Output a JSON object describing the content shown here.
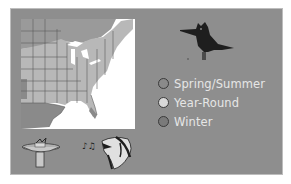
{
  "legend": {
    "items": [
      {
        "label": "Spring/Summer",
        "color": "#8a8a8a"
      },
      {
        "label": "Year-Round",
        "color": "#d9d9d9"
      },
      {
        "label": "Winter",
        "color": "#7a7a7a"
      }
    ]
  },
  "colors": {
    "panel": "#8e8e8e",
    "map_year_round": "#b8b8b8",
    "map_summer": "#9a9a9a",
    "map_winter": "#8a8a8a",
    "bird": "#1e1e1e"
  },
  "icons": {
    "bird": "belted-kingfisher-silhouette-icon",
    "feeder": "bird-bath-icon",
    "song": "singing-bird-icon"
  }
}
